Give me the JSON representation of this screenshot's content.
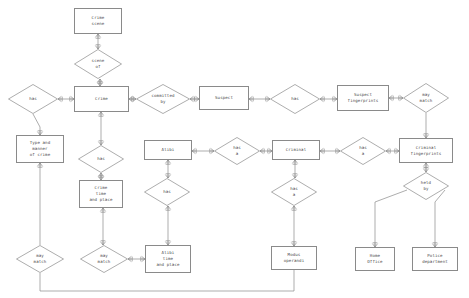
{
  "diagram": {
    "type": "er-diagram",
    "stroke_color": "#8a8a8a",
    "text_color": "#4a4a4a",
    "background_color": "#ffffff",
    "entities": [
      {
        "id": "crime_scene",
        "label": "Crime\nscene",
        "x": 74,
        "y": 8,
        "w": 48,
        "h": 26
      },
      {
        "id": "crime",
        "label": "Crime",
        "x": 74,
        "y": 86,
        "w": 55,
        "h": 26
      },
      {
        "id": "type_manner_of_crime",
        "label": "Type and\nmanner\nof crime",
        "x": 16,
        "y": 135,
        "w": 48,
        "h": 28
      },
      {
        "id": "suspect",
        "label": "Suspect",
        "x": 199,
        "y": 86,
        "w": 50,
        "h": 24
      },
      {
        "id": "suspect_fingerprints",
        "label": "Suspect\nfingerprints",
        "x": 337,
        "y": 85,
        "w": 52,
        "h": 26
      },
      {
        "id": "criminal_fingerprints",
        "label": "Criminal\nfingerprints",
        "x": 399,
        "y": 138,
        "w": 54,
        "h": 25
      },
      {
        "id": "criminal",
        "label": "Criminal",
        "x": 272,
        "y": 140,
        "w": 48,
        "h": 20
      },
      {
        "id": "alibi",
        "label": "Alibi",
        "x": 144,
        "y": 140,
        "w": 48,
        "h": 20
      },
      {
        "id": "crime_time_place",
        "label": "Crime\ntime\nand place",
        "x": 79,
        "y": 180,
        "w": 44,
        "h": 28
      },
      {
        "id": "alibi_time_place",
        "label": "Alibi\ntime\nand place",
        "x": 145,
        "y": 245,
        "w": 46,
        "h": 28
      },
      {
        "id": "modus_operandi",
        "label": "Modus\noperandi",
        "x": 271,
        "y": 246,
        "w": 46,
        "h": 24
      },
      {
        "id": "home_office",
        "label": "Home\nOffice",
        "x": 355,
        "y": 247,
        "w": 40,
        "h": 24
      },
      {
        "id": "police_department",
        "label": "Police\ndepartment",
        "x": 412,
        "y": 247,
        "w": 46,
        "h": 24
      }
    ],
    "relationships": [
      {
        "id": "scene_of",
        "label": "scene\nof",
        "x": 74,
        "y": 49,
        "w": 48,
        "h": 30
      },
      {
        "id": "crime_has",
        "label": "has",
        "x": 8,
        "y": 84,
        "w": 50,
        "h": 30
      },
      {
        "id": "committed_by",
        "label": "committed\nby",
        "x": 136,
        "y": 84,
        "w": 54,
        "h": 30
      },
      {
        "id": "suspect_has",
        "label": "has",
        "x": 270,
        "y": 84,
        "w": 50,
        "h": 30
      },
      {
        "id": "fp_may_match",
        "label": "may\nmatch",
        "x": 403,
        "y": 83,
        "w": 46,
        "h": 30
      },
      {
        "id": "alibi_has_a",
        "label": "has\na",
        "x": 214,
        "y": 137,
        "w": 46,
        "h": 28
      },
      {
        "id": "crim_fp_has_a",
        "label": "has\na",
        "x": 340,
        "y": 137,
        "w": 46,
        "h": 28
      },
      {
        "id": "crime_has_time",
        "label": "has",
        "x": 78,
        "y": 145,
        "w": 46,
        "h": 28
      },
      {
        "id": "alibi_has",
        "label": "has",
        "x": 144,
        "y": 178,
        "w": 46,
        "h": 28
      },
      {
        "id": "criminal_has_a",
        "label": "has\na",
        "x": 271,
        "y": 178,
        "w": 46,
        "h": 28
      },
      {
        "id": "held_by",
        "label": "held\nby",
        "x": 403,
        "y": 172,
        "w": 46,
        "h": 28
      },
      {
        "id": "type_may_match",
        "label": "may\nmatch",
        "x": 16,
        "y": 245,
        "w": 48,
        "h": 28
      },
      {
        "id": "time_may_match",
        "label": "may\nmatch",
        "x": 80,
        "y": 245,
        "w": 48,
        "h": 28
      }
    ],
    "connections": [
      {
        "from": "crime_scene",
        "to": "scene_of",
        "notation": "one-to-many"
      },
      {
        "from": "scene_of",
        "to": "crime",
        "notation": "one-to-many"
      },
      {
        "from": "crime_has",
        "to": "crime",
        "notation": "one-to-many"
      },
      {
        "from": "crime_has",
        "to": "type_manner_of_crime",
        "notation": "one-to-many"
      },
      {
        "from": "crime",
        "to": "committed_by",
        "notation": "one-to-many"
      },
      {
        "from": "committed_by",
        "to": "suspect",
        "notation": "one-to-many"
      },
      {
        "from": "suspect",
        "to": "suspect_has",
        "notation": "one-to-many"
      },
      {
        "from": "suspect_has",
        "to": "suspect_fingerprints",
        "notation": "one-to-many"
      },
      {
        "from": "suspect_fingerprints",
        "to": "fp_may_match",
        "notation": "one-to-many"
      },
      {
        "from": "fp_may_match",
        "to": "criminal_fingerprints",
        "notation": "one-to-many"
      },
      {
        "from": "alibi",
        "to": "alibi_has_a",
        "notation": "one-to-many"
      },
      {
        "from": "alibi_has_a",
        "to": "criminal",
        "notation": "one-to-many"
      },
      {
        "from": "criminal",
        "to": "crim_fp_has_a",
        "notation": "one-to-many"
      },
      {
        "from": "crim_fp_has_a",
        "to": "criminal_fingerprints",
        "notation": "one-to-many"
      },
      {
        "from": "crime",
        "to": "crime_has_time",
        "notation": "one-to-many"
      },
      {
        "from": "crime_has_time",
        "to": "crime_time_place",
        "notation": "one-to-many"
      },
      {
        "from": "crime_time_place",
        "to": "time_may_match",
        "notation": "one-to-many"
      },
      {
        "from": "time_may_match",
        "to": "alibi_time_place",
        "notation": "one-to-many"
      },
      {
        "from": "alibi",
        "to": "alibi_has",
        "notation": "one-to-many"
      },
      {
        "from": "alibi_has",
        "to": "alibi_time_place",
        "notation": "one-to-many"
      },
      {
        "from": "criminal",
        "to": "criminal_has_a",
        "notation": "one-to-many"
      },
      {
        "from": "criminal_has_a",
        "to": "modus_operandi",
        "notation": "one-to-many"
      },
      {
        "from": "criminal_fingerprints",
        "to": "held_by",
        "notation": "one-to-many"
      },
      {
        "from": "held_by",
        "to": "home_office",
        "notation": "one-to-many"
      },
      {
        "from": "held_by",
        "to": "police_department",
        "notation": "one-to-many"
      },
      {
        "from": "type_manner_of_crime",
        "to": "type_may_match",
        "notation": "one-to-many"
      },
      {
        "from": "type_may_match",
        "to": "modus_operandi",
        "notation": "one-to-many"
      }
    ]
  }
}
